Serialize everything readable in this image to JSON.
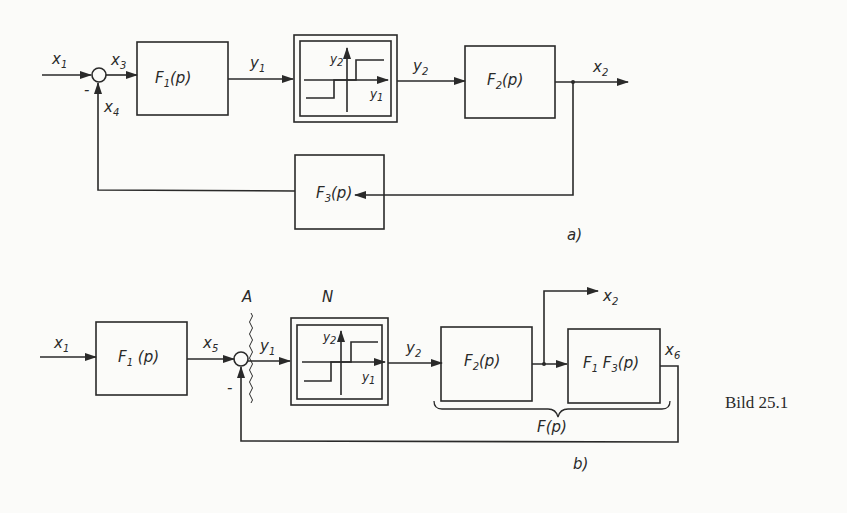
{
  "figure": {
    "caption": "Bild 25.1",
    "panel_a": {
      "label": "a)",
      "signals": {
        "input": "x1",
        "sum_out": "x3",
        "feedback": "x4",
        "f1_out": "y1",
        "n_out": "y2",
        "output": "x2"
      },
      "blocks": {
        "f1": "F1(p)",
        "f2": "F2(p)",
        "f3": "F3(p)",
        "nonlinear": "three-level relay"
      },
      "sum_sign": "-",
      "nl_axes": {
        "x": "y1",
        "y": "y2"
      }
    },
    "panel_b": {
      "label": "b)",
      "signals": {
        "input": "x1",
        "f1_out": "x5",
        "sum_out": "y1",
        "n_out": "y2",
        "branch_out": "x2",
        "loop_out": "x6"
      },
      "blocks": {
        "f1": "F1(p)",
        "f2": "F2(p)",
        "f1f3": "F1 F3(p)",
        "nonlinear": "N"
      },
      "cut_label": "A",
      "brace_label": "F(p)",
      "sum_sign": "-",
      "nl_axes": {
        "x": "y1",
        "y": "y2"
      }
    }
  }
}
